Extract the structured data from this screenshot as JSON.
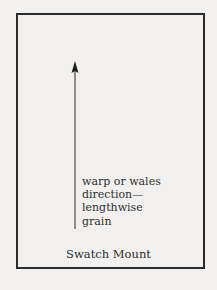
{
  "diagram": {
    "label_lines": [
      "warp or wales",
      "direction—",
      "lengthwise",
      "grain"
    ],
    "caption": "Swatch Mount",
    "arrow": {
      "direction": "up",
      "icon": "arrow-up-icon"
    },
    "colors": {
      "background": "#f1f0ee",
      "ink": "#2b2b2b"
    }
  }
}
